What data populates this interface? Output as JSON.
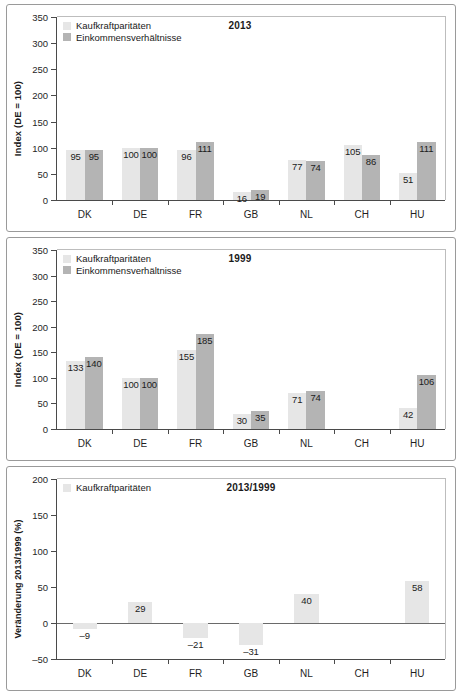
{
  "figure": {
    "panels": [
      {
        "title": "2013",
        "ylabel": "Index (DE = 100)",
        "legend": [
          "Kaufkraftparitäten",
          "Einkommensverhältnisse"
        ],
        "yticks": [
          "0",
          "50",
          "100",
          "150",
          "200",
          "250",
          "300",
          "350"
        ],
        "categories": [
          "DK",
          "DE",
          "FR",
          "GB",
          "NL",
          "CH",
          "HU"
        ]
      },
      {
        "title": "1999",
        "ylabel": "Index (DE = 100)",
        "legend": [
          "Kaufkraftparitäten",
          "Einkommensverhältnisse"
        ],
        "yticks": [
          "0",
          "50",
          "100",
          "150",
          "200",
          "250",
          "300",
          "350"
        ],
        "categories": [
          "DK",
          "DE",
          "FR",
          "GB",
          "NL",
          "CH",
          "HU"
        ]
      },
      {
        "title": "2013/1999",
        "ylabel": "Veränderung 2013/1999 (%)",
        "legend": [
          "Kaufkraftparitäten"
        ],
        "yticks": [
          "-50",
          "0",
          "50",
          "100",
          "150",
          "200"
        ],
        "categories": [
          "DK",
          "DE",
          "FR",
          "GB",
          "NL",
          "CH",
          "HU"
        ]
      }
    ],
    "colors": {
      "series1": "#e6e6e6",
      "series2": "#b4b4b4",
      "axis": "#4a4a4a",
      "text": "#1b1b1b"
    }
  },
  "chart_data": [
    {
      "type": "bar",
      "title": "2013",
      "xlabel": "",
      "ylabel": "Index (DE = 100)",
      "ylim": [
        0,
        350
      ],
      "ytick_step": 50,
      "grid": false,
      "legend_position": "top-left",
      "categories": [
        "DK",
        "DE",
        "FR",
        "GB",
        "NL",
        "CH",
        "HU"
      ],
      "series": [
        {
          "name": "Kaufkraftparitäten",
          "values": [
            95,
            100,
            96,
            16,
            77,
            105,
            51
          ]
        },
        {
          "name": "Einkommensverhältnisse",
          "values": [
            95,
            100,
            111,
            19,
            74,
            86,
            111
          ]
        }
      ]
    },
    {
      "type": "bar",
      "title": "1999",
      "xlabel": "",
      "ylabel": "Index (DE = 100)",
      "ylim": [
        0,
        350
      ],
      "ytick_step": 50,
      "grid": false,
      "legend_position": "top-left",
      "categories": [
        "DK",
        "DE",
        "FR",
        "GB",
        "NL",
        "CH",
        "HU"
      ],
      "series": [
        {
          "name": "Kaufkraftparitäten",
          "values": [
            133,
            100,
            155,
            30,
            71,
            null,
            42
          ]
        },
        {
          "name": "Einkommensverhältnisse",
          "values": [
            140,
            100,
            185,
            35,
            74,
            null,
            106
          ]
        }
      ]
    },
    {
      "type": "bar",
      "title": "2013/1999",
      "xlabel": "",
      "ylabel": "Veränderung 2013/1999 (%)",
      "ylim": [
        -50,
        200
      ],
      "ytick_step": 50,
      "grid": false,
      "legend_position": "top-left",
      "categories": [
        "DK",
        "DE",
        "FR",
        "GB",
        "NL",
        "CH",
        "HU"
      ],
      "series": [
        {
          "name": "Kaufkraftparitäten",
          "values": [
            -9,
            29,
            -21,
            -31,
            40,
            null,
            58
          ]
        }
      ]
    }
  ]
}
